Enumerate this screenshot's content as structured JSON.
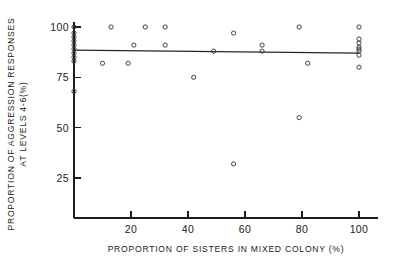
{
  "chart_data": {
    "type": "scatter",
    "title": "",
    "xlabel": "PROPORTION OF SISTERS IN MIXED COLONY (%)",
    "ylabel_line1": "PROPORTION OF AGGRESSION RESPONSES",
    "ylabel_line2": "AT LEVELS 4-6(%)",
    "xlim": [
      0,
      104
    ],
    "ylim": [
      0,
      104
    ],
    "xticks": [
      20,
      40,
      60,
      80,
      100
    ],
    "xtick_labels": [
      "20",
      "40",
      "60",
      "80",
      "100"
    ],
    "yticks": [
      25,
      50,
      75,
      100
    ],
    "ytick_labels": [
      "25",
      "50",
      "75",
      "100"
    ],
    "grid": false,
    "legend": "none",
    "marker": "open-circle",
    "points": [
      {
        "x": 0,
        "y": 100
      },
      {
        "x": 0,
        "y": 97
      },
      {
        "x": 0,
        "y": 95
      },
      {
        "x": 0,
        "y": 93
      },
      {
        "x": 0,
        "y": 91
      },
      {
        "x": 0,
        "y": 89
      },
      {
        "x": 0,
        "y": 87
      },
      {
        "x": 0,
        "y": 85
      },
      {
        "x": 0,
        "y": 83
      },
      {
        "x": 0,
        "y": 68
      },
      {
        "x": 10,
        "y": 82
      },
      {
        "x": 13,
        "y": 100
      },
      {
        "x": 19,
        "y": 82
      },
      {
        "x": 21,
        "y": 91
      },
      {
        "x": 25,
        "y": 100
      },
      {
        "x": 32,
        "y": 100
      },
      {
        "x": 32,
        "y": 91
      },
      {
        "x": 42,
        "y": 75
      },
      {
        "x": 49,
        "y": 88
      },
      {
        "x": 56,
        "y": 97
      },
      {
        "x": 56,
        "y": 32
      },
      {
        "x": 66,
        "y": 91
      },
      {
        "x": 66,
        "y": 88
      },
      {
        "x": 79,
        "y": 100
      },
      {
        "x": 79,
        "y": 55
      },
      {
        "x": 82,
        "y": 82
      },
      {
        "x": 100,
        "y": 100
      },
      {
        "x": 100,
        "y": 94
      },
      {
        "x": 100,
        "y": 92
      },
      {
        "x": 100,
        "y": 90
      },
      {
        "x": 100,
        "y": 89
      },
      {
        "x": 100,
        "y": 88
      },
      {
        "x": 100,
        "y": 86
      },
      {
        "x": 100,
        "y": 80
      }
    ],
    "fit_line": {
      "x0": 0,
      "y0": 88.5,
      "x1": 100,
      "y1": 87.0
    }
  }
}
